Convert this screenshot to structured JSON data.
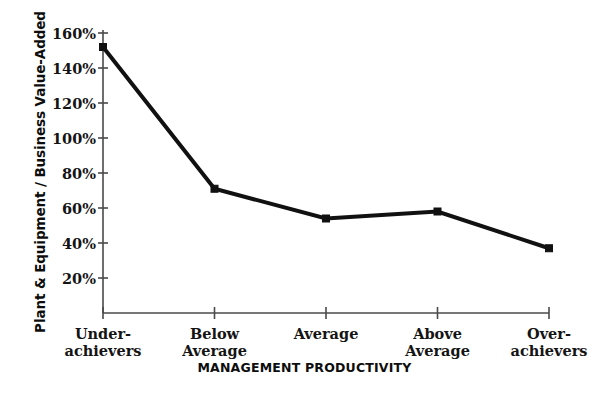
{
  "chart_data": {
    "type": "line",
    "title": "",
    "xlabel": "MANAGEMENT PRODUCTIVITY",
    "ylabel": "Plant & Equipment / Business Value-Added",
    "categories": [
      "Under-\nachievers",
      "Below\nAverage",
      "Average",
      "Above\nAverage",
      "Over-\nachievers"
    ],
    "category_labels": [
      {
        "line1": "Under-",
        "line2": "achievers"
      },
      {
        "line1": "Below",
        "line2": "Average"
      },
      {
        "line1": "Average",
        "line2": ""
      },
      {
        "line1": "Above",
        "line2": "Average"
      },
      {
        "line1": "Over-",
        "line2": "achievers"
      }
    ],
    "values": [
      152,
      71,
      54,
      58,
      37
    ],
    "value_labels": [
      "152%",
      "71%",
      "54%",
      "58%",
      "37%"
    ],
    "ylim": [
      0,
      160
    ],
    "ytick_values": [
      20,
      40,
      60,
      80,
      100,
      120,
      140,
      160
    ],
    "ytick_labels": [
      "20%",
      "40%",
      "60%",
      "80%",
      "100%",
      "120%",
      "140%",
      "160%"
    ],
    "grid": false,
    "legend": null,
    "marker": "square",
    "line_color": "#111111",
    "marker_color": "#111111",
    "axis_color": "#4a4a4a",
    "background_color": "#ffffff",
    "line_width_px": 4,
    "marker_size_px": 7
  }
}
